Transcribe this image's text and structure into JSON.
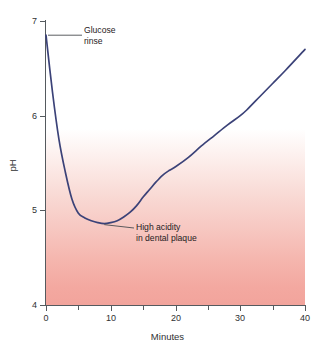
{
  "chart_data": {
    "type": "line",
    "title": "",
    "xlabel": "Minutes",
    "ylabel": "pH",
    "xlim": [
      0,
      40
    ],
    "ylim": [
      4,
      7
    ],
    "grid": false,
    "legend": null,
    "x_ticks": [
      "0",
      "10",
      "20",
      "30",
      "40"
    ],
    "x_tick_values": [
      0,
      10,
      20,
      30,
      40
    ],
    "x_minor_tick_values": [
      5,
      15,
      25,
      35
    ],
    "y_ticks": [
      "4",
      "5",
      "6",
      "7"
    ],
    "y_tick_values": [
      4,
      5,
      6,
      7
    ],
    "series": [
      {
        "name": "Dental plaque pH after glucose rinse",
        "color": "#3b4278",
        "x": [
          0,
          1,
          2,
          3,
          4,
          5,
          6,
          7,
          8,
          9,
          10,
          11,
          12,
          13,
          14,
          15,
          16,
          17,
          18,
          19,
          20,
          22,
          24,
          26,
          28,
          30,
          31,
          33,
          35,
          37,
          40
        ],
        "y": [
          6.85,
          6.25,
          5.75,
          5.4,
          5.12,
          4.97,
          4.92,
          4.89,
          4.87,
          4.86,
          4.87,
          4.89,
          4.93,
          4.98,
          5.05,
          5.14,
          5.22,
          5.3,
          5.37,
          5.42,
          5.46,
          5.56,
          5.68,
          5.79,
          5.9,
          6.0,
          6.06,
          6.2,
          6.34,
          6.48,
          6.7
        ]
      }
    ],
    "annotations": [
      {
        "id": "glucose-rinse",
        "text_line1": "Glucose",
        "text_line2": "rinse",
        "points_to_x": 0,
        "points_to_y": 6.85
      },
      {
        "id": "high-acidity",
        "text_line1": "High acidity",
        "text_line2": "in dental plaque",
        "points_to_x": 9,
        "points_to_y": 4.87
      }
    ],
    "background": {
      "description": "vertical gradient from white at high pH to salmon at low pH indicating acidity",
      "top_color": "#ffffff",
      "bottom_color": "#f2a49c"
    }
  },
  "axes": {
    "x_title": "Minutes",
    "y_title": "pH"
  }
}
